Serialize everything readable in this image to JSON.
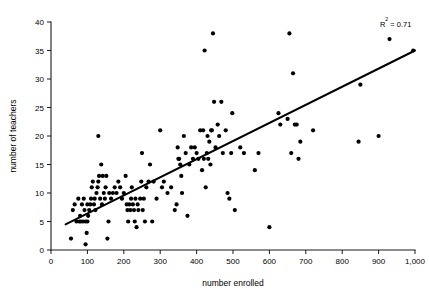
{
  "chart_data": {
    "type": "scatter",
    "title": "",
    "xlabel": "number enrolled",
    "ylabel": "number of teachers",
    "xlim": [
      0,
      1000
    ],
    "ylim": [
      0,
      40
    ],
    "xticks": [
      0,
      100,
      200,
      300,
      400,
      500,
      600,
      700,
      800,
      900,
      1000
    ],
    "xticklabels": [
      "0",
      "100",
      "200",
      "300",
      "400",
      "500",
      "600",
      "700",
      "800",
      "900",
      "1,000"
    ],
    "yticks": [
      0,
      5,
      10,
      15,
      20,
      25,
      30,
      35,
      40
    ],
    "yticklabels": [
      "0",
      "5",
      "10",
      "15",
      "20",
      "25",
      "30",
      "35",
      "40"
    ],
    "grid": false,
    "legend": null,
    "annotations": [
      {
        "name": "r-squared",
        "text_prefix": "R",
        "text_sup": "2",
        "text_suffix": " = 0.71",
        "full_text": "R² = 0.71",
        "x": 990,
        "y": 39.2
      }
    ],
    "marker": {
      "shape": "circle",
      "color": "#000000",
      "size_px": 3.0
    },
    "trendline": {
      "name": "linear-regression-line",
      "color": "#000000",
      "x_start": 40,
      "y_start": 4.5,
      "x_end": 1000,
      "y_end": 35.0,
      "r_squared": 0.71
    },
    "points": [
      [
        55,
        2
      ],
      [
        60,
        7
      ],
      [
        65,
        8
      ],
      [
        70,
        5
      ],
      [
        75,
        9
      ],
      [
        78,
        5
      ],
      [
        80,
        6
      ],
      [
        82,
        5
      ],
      [
        85,
        8
      ],
      [
        88,
        5
      ],
      [
        90,
        9
      ],
      [
        92,
        7
      ],
      [
        95,
        5
      ],
      [
        95,
        1
      ],
      [
        98,
        3
      ],
      [
        100,
        5
      ],
      [
        100,
        8
      ],
      [
        102,
        6
      ],
      [
        105,
        7
      ],
      [
        108,
        8
      ],
      [
        110,
        9
      ],
      [
        112,
        11
      ],
      [
        115,
        12
      ],
      [
        118,
        8
      ],
      [
        120,
        9
      ],
      [
        122,
        7
      ],
      [
        125,
        10
      ],
      [
        128,
        11
      ],
      [
        130,
        20
      ],
      [
        130,
        12
      ],
      [
        132,
        13
      ],
      [
        135,
        9
      ],
      [
        138,
        15
      ],
      [
        140,
        8
      ],
      [
        142,
        13
      ],
      [
        145,
        10
      ],
      [
        148,
        9
      ],
      [
        150,
        11
      ],
      [
        152,
        13
      ],
      [
        155,
        2
      ],
      [
        158,
        5
      ],
      [
        160,
        10
      ],
      [
        165,
        9
      ],
      [
        170,
        10
      ],
      [
        175,
        11
      ],
      [
        180,
        10
      ],
      [
        185,
        12
      ],
      [
        190,
        11
      ],
      [
        195,
        9
      ],
      [
        200,
        10
      ],
      [
        205,
        13
      ],
      [
        208,
        8
      ],
      [
        210,
        7
      ],
      [
        212,
        5
      ],
      [
        215,
        8
      ],
      [
        218,
        7
      ],
      [
        220,
        9
      ],
      [
        222,
        11
      ],
      [
        225,
        8
      ],
      [
        228,
        7
      ],
      [
        230,
        5
      ],
      [
        232,
        9
      ],
      [
        235,
        4
      ],
      [
        238,
        8
      ],
      [
        240,
        7
      ],
      [
        245,
        9
      ],
      [
        248,
        12
      ],
      [
        250,
        17
      ],
      [
        252,
        7
      ],
      [
        255,
        9
      ],
      [
        258,
        5
      ],
      [
        262,
        11
      ],
      [
        268,
        12
      ],
      [
        272,
        15
      ],
      [
        278,
        5
      ],
      [
        282,
        12
      ],
      [
        290,
        9
      ],
      [
        300,
        21
      ],
      [
        305,
        11
      ],
      [
        310,
        12
      ],
      [
        320,
        10
      ],
      [
        330,
        11
      ],
      [
        340,
        7
      ],
      [
        345,
        8
      ],
      [
        348,
        18
      ],
      [
        350,
        16
      ],
      [
        352,
        16
      ],
      [
        355,
        15
      ],
      [
        358,
        13
      ],
      [
        360,
        10
      ],
      [
        365,
        20
      ],
      [
        370,
        17
      ],
      [
        375,
        6
      ],
      [
        380,
        15
      ],
      [
        385,
        18
      ],
      [
        390,
        16
      ],
      [
        395,
        18
      ],
      [
        400,
        17
      ],
      [
        405,
        16
      ],
      [
        410,
        21
      ],
      [
        415,
        14
      ],
      [
        418,
        21
      ],
      [
        420,
        16
      ],
      [
        422,
        35
      ],
      [
        425,
        11
      ],
      [
        428,
        17
      ],
      [
        430,
        20
      ],
      [
        432,
        16
      ],
      [
        435,
        19
      ],
      [
        438,
        15
      ],
      [
        440,
        21
      ],
      [
        442,
        21
      ],
      [
        445,
        38
      ],
      [
        448,
        26
      ],
      [
        452,
        18
      ],
      [
        458,
        22
      ],
      [
        462,
        20
      ],
      [
        468,
        26
      ],
      [
        472,
        17
      ],
      [
        480,
        21
      ],
      [
        485,
        10
      ],
      [
        490,
        9
      ],
      [
        495,
        17
      ],
      [
        498,
        24
      ],
      [
        505,
        7
      ],
      [
        520,
        18
      ],
      [
        530,
        17
      ],
      [
        560,
        14
      ],
      [
        570,
        17
      ],
      [
        600,
        4
      ],
      [
        625,
        24
      ],
      [
        630,
        22
      ],
      [
        650,
        23
      ],
      [
        655,
        38
      ],
      [
        660,
        17
      ],
      [
        665,
        31
      ],
      [
        670,
        22
      ],
      [
        675,
        22
      ],
      [
        680,
        16
      ],
      [
        685,
        19
      ],
      [
        720,
        21
      ],
      [
        845,
        19
      ],
      [
        850,
        29
      ],
      [
        900,
        20
      ],
      [
        930,
        37
      ],
      [
        995,
        35
      ]
    ]
  }
}
